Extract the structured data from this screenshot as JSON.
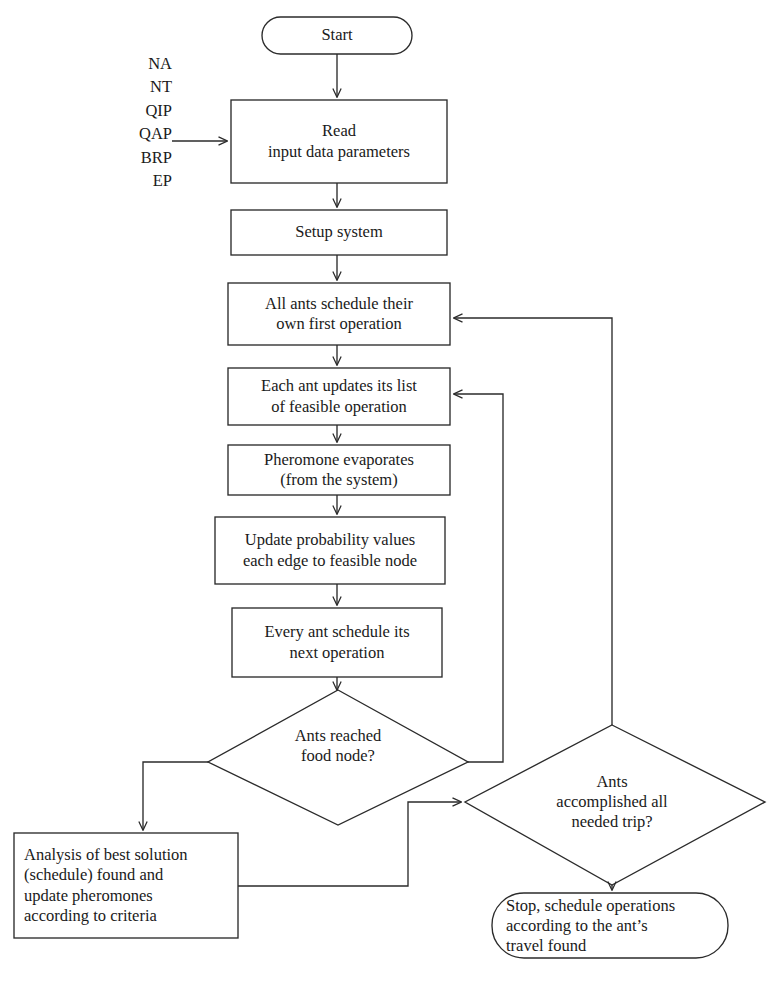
{
  "diagram": {
    "stroke_color": "#2b2b2b",
    "background_color": "#ffffff"
  },
  "inputs": {
    "name": "input-parameter-list",
    "items": [
      "NA",
      "NT",
      "QIP",
      "QAP",
      "BRP",
      "EP"
    ]
  },
  "nodes": {
    "start": {
      "label": "Start",
      "shape": "terminator"
    },
    "read_input": {
      "line1": "Read",
      "line2": "input data parameters",
      "shape": "process"
    },
    "setup": {
      "label": "Setup system",
      "shape": "process"
    },
    "all_ants_first": {
      "line1": "All ants schedule their",
      "line2": "own first operation",
      "shape": "process"
    },
    "each_ant_updates": {
      "line1": "Each ant updates its list",
      "line2": "of feasible operation",
      "shape": "process"
    },
    "pheromone_evap": {
      "line1": "Pheromone evaporates",
      "line2": "(from the system)",
      "shape": "process"
    },
    "update_prob": {
      "line1": "Update probability values",
      "line2": "each edge to feasible node",
      "shape": "process"
    },
    "every_ant_next": {
      "line1": "Every ant schedule its",
      "line2": "next operation",
      "shape": "process"
    },
    "ants_reached_food": {
      "line1": "Ants reached",
      "line2": "food node?",
      "shape": "decision"
    },
    "ants_accomplished": {
      "line1": "Ants",
      "line2": "accomplished all",
      "line3": "needed trip?",
      "shape": "decision"
    },
    "analysis": {
      "line1": "Analysis of best solution",
      "line2": "(schedule) found and",
      "line3": "update pheromones",
      "line4": "according to criteria",
      "shape": "process"
    },
    "stop": {
      "line1": "Stop, schedule operations",
      "line2": "according to the ant’s",
      "line3": "travel found",
      "shape": "terminator"
    }
  }
}
